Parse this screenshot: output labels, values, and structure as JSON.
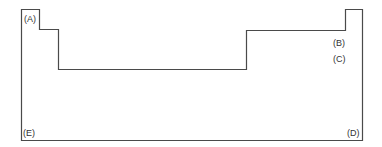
{
  "diagram": {
    "type": "periodic-table-outline",
    "stroke_color": "#4a4a4a",
    "background": "#ffffff",
    "labels": {
      "a": "(A)",
      "b": "(B)",
      "c": "(C)",
      "d": "(D)",
      "e": "(E)"
    }
  }
}
